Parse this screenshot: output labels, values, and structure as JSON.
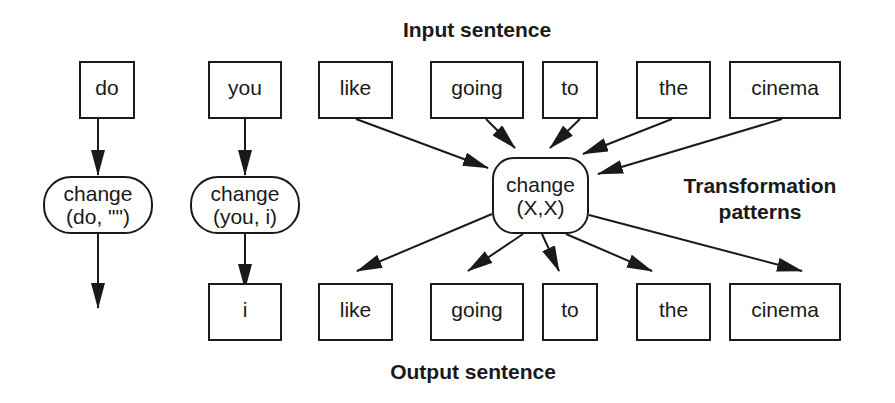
{
  "titles": {
    "input": "Input sentence",
    "output": "Output sentence",
    "patterns_line1": "Transformation",
    "patterns_line2": "patterns"
  },
  "input_words": [
    "do",
    "you",
    "like",
    "going",
    "to",
    "the",
    "cinema"
  ],
  "output_words": [
    "i",
    "like",
    "going",
    "to",
    "the",
    "cinema"
  ],
  "patterns": [
    {
      "line1": "change",
      "line2": "(do, \"\")"
    },
    {
      "line1": "change",
      "line2": "(you, i)"
    },
    {
      "line1": "change",
      "line2": "(X,X)"
    }
  ],
  "colors": {
    "stroke": "#1a1a1a",
    "background": "#ffffff"
  }
}
